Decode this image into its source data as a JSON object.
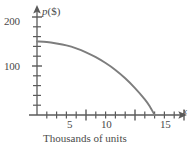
{
  "chart_data": {
    "type": "line",
    "title": "",
    "subtitle": "",
    "xlabel": "Thousands of units",
    "ylabel": "p ($)",
    "x_axis_symbol": "x",
    "y_axis_symbol": "p",
    "y_axis_unit": "($)",
    "xlim": [
      0,
      16
    ],
    "ylim": [
      0,
      210
    ],
    "grid": false,
    "legend": null,
    "x_major_ticks": [
      5,
      10,
      15
    ],
    "x_major_tick_labels": [
      "5",
      "10",
      "15"
    ],
    "x_minor_tick_interval": 1,
    "y_major_ticks": [
      100,
      200
    ],
    "y_major_tick_labels": [
      "100",
      "200"
    ],
    "y_minor_tick_interval": 20,
    "annotations": [],
    "series": [
      {
        "name": "demand curve",
        "color": "#7d7d7d",
        "x": [
          0,
          1,
          2,
          3,
          4,
          5,
          6,
          7,
          8,
          9,
          10,
          11,
          11.5,
          12
        ],
        "values": [
          150,
          149,
          146,
          142,
          136,
          128,
          118,
          106,
          92,
          75,
          55,
          32,
          18,
          0
        ]
      }
    ]
  },
  "axes": {
    "y_label_200": "200",
    "y_label_100": "100",
    "x_label_5": "5",
    "x_label_10": "10",
    "x_label_15": "15",
    "y_axis_name_symbol": "p",
    "y_axis_name_unit": "($)",
    "x_axis_name_symbol": "x",
    "x_axis_caption": "Thousands of units"
  },
  "colors": {
    "curve": "#7d7d7d",
    "axis": "#5a5a5a",
    "text": "#4a4a4a",
    "background": "#ffffff"
  }
}
